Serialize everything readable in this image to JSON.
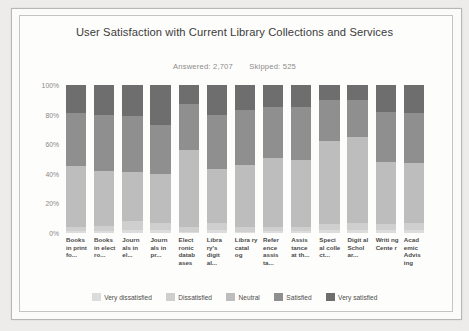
{
  "chart_data": {
    "type": "bar",
    "subtype": "stacked-100-percent",
    "title": "User Satisfaction with Current Library Collections and Services",
    "answered_label": "Answered: 2,707",
    "skipped_label": "Skipped: 525",
    "answered": 2707,
    "skipped": 525,
    "xlabel": "",
    "ylabel": "",
    "ylim": [
      0,
      100
    ],
    "grid": false,
    "legend_position": "bottom",
    "ytick_labels": [
      "100%",
      "80%",
      "60%",
      "40%",
      "20%",
      "0%"
    ],
    "ytick_values": [
      100,
      80,
      60,
      40,
      20,
      0
    ],
    "categories": [
      "Books in print fo...",
      "Books in elect ro...",
      "Journ als in el...",
      "Journ als in pr...",
      "Elect ronic datab ases",
      "Libra ry's digit al...",
      "Libra ry catal og",
      "Refer ence assis ta...",
      "Assis tance at th...",
      "Speci al colle ct...",
      "Digit al Schol ar...",
      "Writi ng Cente r",
      "Acad emic Advis ing"
    ],
    "series": [
      {
        "name": "Very dissatisfied",
        "color": "#dcdcdc",
        "values": [
          1,
          1,
          2,
          2,
          1,
          2,
          1,
          1,
          1,
          2,
          2,
          2,
          2
        ]
      },
      {
        "name": "Dissatisfied",
        "color": "#cfcfcf",
        "values": [
          3,
          4,
          6,
          5,
          3,
          5,
          3,
          3,
          3,
          4,
          5,
          4,
          5
        ]
      },
      {
        "name": "Neutral",
        "color": "#bdbdbd",
        "values": [
          41,
          37,
          33,
          33,
          52,
          36,
          42,
          47,
          45,
          56,
          58,
          42,
          40
        ]
      },
      {
        "name": "Satisfied",
        "color": "#8f8f8f",
        "values": [
          36,
          38,
          38,
          33,
          31,
          37,
          37,
          34,
          36,
          28,
          25,
          34,
          34
        ]
      },
      {
        "name": "Very satisfied",
        "color": "#6e6e6e",
        "values": [
          19,
          20,
          21,
          27,
          13,
          20,
          17,
          15,
          15,
          10,
          10,
          18,
          19
        ]
      }
    ]
  },
  "legend": {
    "items": [
      {
        "label": "Very dissatisfied",
        "color": "#dcdcdc"
      },
      {
        "label": "Dissatisfied",
        "color": "#cfcfcf"
      },
      {
        "label": "Neutral",
        "color": "#bdbdbd"
      },
      {
        "label": "Satisfied",
        "color": "#8f8f8f"
      },
      {
        "label": "Very satisfied",
        "color": "#6e6e6e"
      }
    ]
  }
}
